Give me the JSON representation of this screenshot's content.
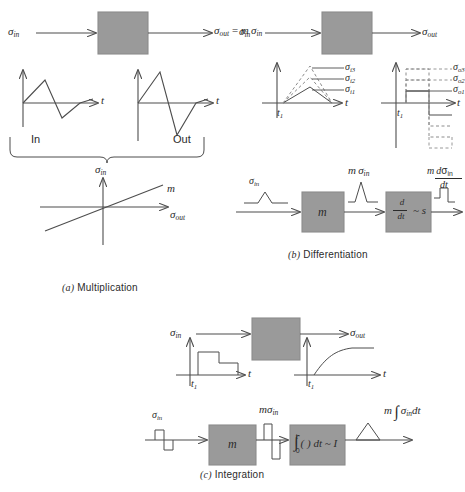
{
  "figure": {
    "colors": {
      "block_fill": "#9a9a9a",
      "block_stroke": "#808080",
      "line": "#4d4d4d",
      "text": "#2b2b2b",
      "dashed": "#8c8c8c"
    },
    "sections": [
      {
        "id": "a",
        "caption_marker": "(a)",
        "caption_text": "Multiplication",
        "block_diagram": {
          "input_label": "σin",
          "output_label": "σout = m σin"
        },
        "waveforms": [
          {
            "name": "In",
            "axis_label": "t"
          },
          {
            "name": "Out",
            "axis_label": "t"
          }
        ],
        "transfer_plot": {
          "y_axis_label": "σin",
          "x_axis_label": "σout",
          "slope_label": "m"
        }
      },
      {
        "id": "b",
        "caption_marker": "(b)",
        "caption_text": "Differentiation",
        "block_diagram": {
          "input_label": "σin",
          "output_label": "σout"
        },
        "input_plot": {
          "x_axis_label": "t",
          "time_marker": "t1",
          "curve_labels": [
            "σi3",
            "σi2",
            "σi1"
          ]
        },
        "output_plot": {
          "x_axis_label": "t",
          "time_marker": "t1",
          "curve_labels": [
            "σo3",
            "σo2",
            "σo1"
          ]
        },
        "chain": {
          "input_label": "σin",
          "gain_block": "m",
          "mid_label": "m σin",
          "operator_block": "d/dt ~ s",
          "operator_numerator": "d",
          "operator_denominator": "dt",
          "operator_tail": "~ s",
          "output_label": "m dσin/dt",
          "output_numerator": "m dσin",
          "output_denominator": "dt"
        }
      },
      {
        "id": "c",
        "caption_marker": "(c)",
        "caption_text": "Integration",
        "block_diagram": {
          "input_label": "σin",
          "output_label": "σout"
        },
        "input_plot": {
          "x_axis_label": "t",
          "time_marker": "t1"
        },
        "output_plot": {
          "x_axis_label": "t",
          "time_marker": "t1"
        },
        "chain": {
          "input_label": "σin",
          "gain_block": "m",
          "mid_label": "m σin",
          "operator_block": "∫0t ( ) dt ~ I",
          "operator_lower": "0",
          "operator_upper": "t",
          "operator_body": "( ) dt ~ I",
          "output_label": "m ∫ σin dt",
          "output_prefix": "m",
          "output_body": "σin dt"
        }
      }
    ]
  }
}
